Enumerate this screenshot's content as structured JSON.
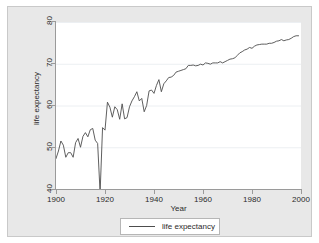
{
  "chart_data": {
    "type": "line",
    "title": "",
    "xlabel": "Year",
    "ylabel": "life expectancy",
    "xlim": [
      1900,
      2000
    ],
    "ylim": [
      40,
      80
    ],
    "xticks": [
      1900,
      1920,
      1940,
      1960,
      1980,
      2000
    ],
    "yticks": [
      40,
      50,
      60,
      70,
      80
    ],
    "grid": "horizontal",
    "legend_position": "bottom-center",
    "series": [
      {
        "name": "life expectancy",
        "color": "#4d4d4d",
        "x": [
          1900,
          1901,
          1902,
          1903,
          1904,
          1905,
          1906,
          1907,
          1908,
          1909,
          1910,
          1911,
          1912,
          1913,
          1914,
          1915,
          1916,
          1917,
          1918,
          1919,
          1920,
          1921,
          1922,
          1923,
          1924,
          1925,
          1926,
          1927,
          1928,
          1929,
          1930,
          1931,
          1932,
          1933,
          1934,
          1935,
          1936,
          1937,
          1938,
          1939,
          1940,
          1941,
          1942,
          1943,
          1944,
          1945,
          1946,
          1947,
          1948,
          1949,
          1950,
          1951,
          1952,
          1953,
          1954,
          1955,
          1956,
          1957,
          1958,
          1959,
          1960,
          1961,
          1962,
          1963,
          1964,
          1965,
          1966,
          1967,
          1968,
          1969,
          1970,
          1971,
          1972,
          1973,
          1974,
          1975,
          1976,
          1977,
          1978,
          1979,
          1980,
          1981,
          1982,
          1983,
          1984,
          1985,
          1986,
          1987,
          1988,
          1989,
          1990,
          1991,
          1992,
          1993,
          1994,
          1995,
          1996,
          1997,
          1998,
          1999
        ],
        "y": [
          47.3,
          49.1,
          51.5,
          50.5,
          47.6,
          48.7,
          48.7,
          47.6,
          51.1,
          52.1,
          50.0,
          52.6,
          53.5,
          52.5,
          54.2,
          54.5,
          51.7,
          50.9,
          39.1,
          54.7,
          54.1,
          60.8,
          59.6,
          57.2,
          59.7,
          59.0,
          56.7,
          60.4,
          56.8,
          57.1,
          59.7,
          61.1,
          62.1,
          63.3,
          61.1,
          61.7,
          58.5,
          60.0,
          63.5,
          63.7,
          62.9,
          64.8,
          66.2,
          63.3,
          65.2,
          65.9,
          66.7,
          66.8,
          67.2,
          68.0,
          68.2,
          68.4,
          68.6,
          68.8,
          69.6,
          69.6,
          69.7,
          69.5,
          69.6,
          69.9,
          69.7,
          70.2,
          70.1,
          69.9,
          70.2,
          70.2,
          70.2,
          70.5,
          70.2,
          70.5,
          70.8,
          71.1,
          71.2,
          71.4,
          72.0,
          72.6,
          72.9,
          73.3,
          73.5,
          73.9,
          73.7,
          74.2,
          74.5,
          74.6,
          74.7,
          74.7,
          74.7,
          74.9,
          74.9,
          75.1,
          75.4,
          75.5,
          75.8,
          75.5,
          75.7,
          75.8,
          76.1,
          76.5,
          76.7,
          76.7
        ]
      }
    ]
  },
  "axes": {
    "y_title": "life expectancy",
    "x_title": "Year",
    "y_tick_labels": [
      "40",
      "50",
      "60",
      "70",
      "80"
    ],
    "x_tick_labels": [
      "1900",
      "1920",
      "1940",
      "1960",
      "1980",
      "2000"
    ]
  },
  "legend": {
    "entries": [
      {
        "label": "life expectancy",
        "color": "#4d4d4d"
      }
    ]
  },
  "style": {
    "graph_region_color": "#e8e8e8",
    "plot_region_color": "#ffffff",
    "line_color": "#4d4d4d",
    "grid_color": "#eceff2",
    "axis_color": "#9a9a9a",
    "text_color": "#2b2b2b"
  }
}
